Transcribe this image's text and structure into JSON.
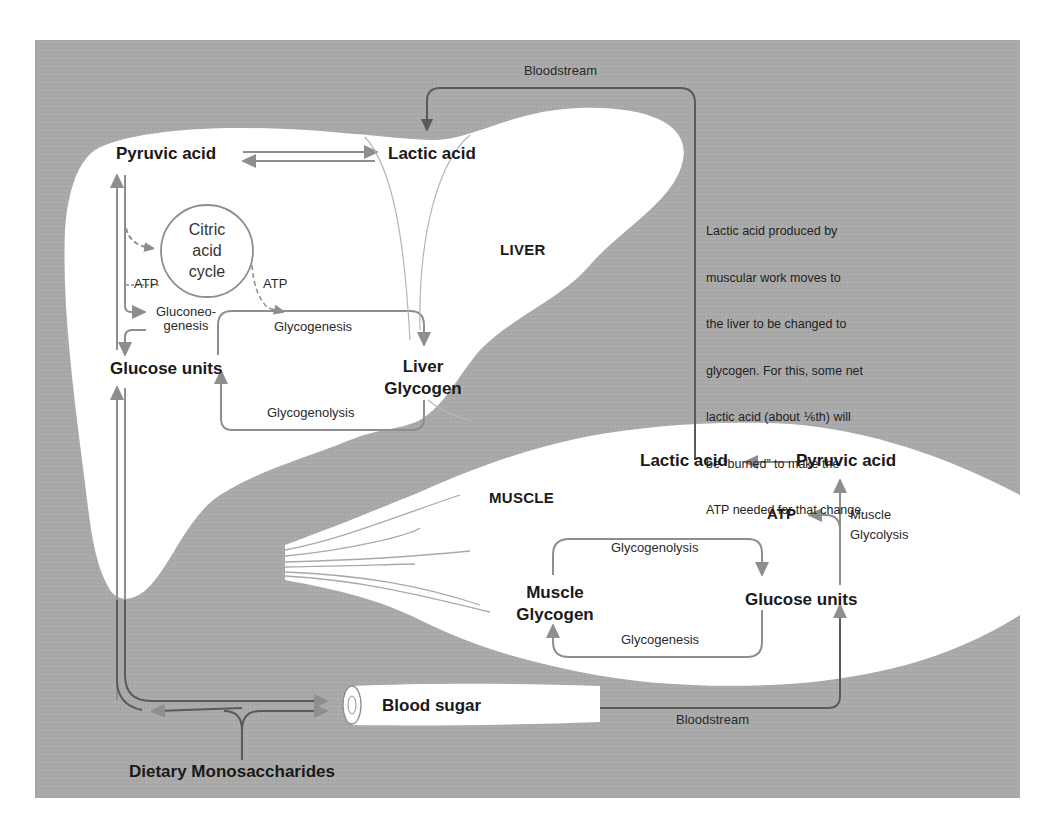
{
  "diagram": {
    "colors": {
      "background_panel": "#a9a9a9",
      "organ_fill": "#ffffff",
      "pathway_arrow": "#8e8e8e",
      "bloodstream_line": "#5a5a5a",
      "text": "#1a1a1a"
    },
    "liver": {
      "organ_label": "LIVER",
      "pyruvic_acid": "Pyruvic acid",
      "lactic_acid": "Lactic acid",
      "citric_acid_cycle": [
        "Citric",
        "acid",
        "cycle"
      ],
      "atp_left": "ATP",
      "atp_right": "ATP",
      "gluconeogenesis": [
        "Gluconeo-",
        "genesis"
      ],
      "glycogenesis": "Glycogenesis",
      "glucose_units": "Glucose units",
      "liver_glycogen": [
        "Liver",
        "Glycogen"
      ],
      "glycogenolysis": "Glycogenolysis"
    },
    "muscle": {
      "organ_label": "MUSCLE",
      "lactic_acid": "Lactic acid",
      "pyruvic_acid": "Pyruvic acid",
      "atp": "ATP",
      "muscle_glycolysis": [
        "Muscle",
        "Glycolysis"
      ],
      "glycogenolysis": "Glycogenolysis",
      "muscle_glycogen": [
        "Muscle",
        "Glycogen"
      ],
      "glucose_units": "Glucose units",
      "glycogenesis": "Glycogenesis"
    },
    "blood": {
      "bloodstream_top": "Bloodstream",
      "bloodstream_bottom": "Bloodstream",
      "blood_sugar": "Blood sugar",
      "dietary_monosaccharides": "Dietary Monosaccharides"
    },
    "annotation": {
      "lines": [
        "Lactic acid produced by",
        "muscular work moves to",
        "the liver to be changed to",
        "glycogen. For this, some net",
        "lactic acid (about ⅙th) will",
        "be “burned” to make the",
        "ATP needed for that change."
      ]
    }
  }
}
